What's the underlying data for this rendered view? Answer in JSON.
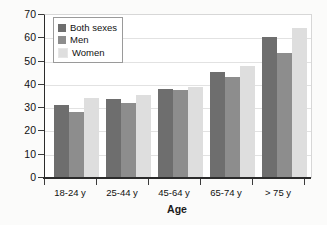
{
  "chart_data": {
    "type": "bar",
    "title": "",
    "xlabel": "Age",
    "ylabel": "Percent Physically Inactive",
    "categories": [
      "18-24 y",
      "25-44 y",
      "45-64 y",
      "65-74 y",
      "> 75 y"
    ],
    "series": [
      {
        "name": "Both sexes",
        "color": "#6e6e6e",
        "values": [
          31.4,
          33.8,
          38.4,
          45.6,
          60.4
        ]
      },
      {
        "name": "Men",
        "color": "#8d8d8d",
        "values": [
          28.4,
          32.2,
          38.0,
          43.5,
          53.6
        ]
      },
      {
        "name": "Women",
        "color": "#dedede",
        "values": [
          34.2,
          35.6,
          38.9,
          47.9,
          64.6
        ]
      }
    ],
    "ylim": [
      0,
      70
    ],
    "yticks": [
      0,
      10,
      20,
      30,
      40,
      50,
      60,
      70
    ],
    "ytick_labels": [
      "0",
      "10",
      "20",
      "30",
      "40",
      "50",
      "60",
      "70"
    ],
    "grid": true,
    "grid_axis": "y",
    "legend_position": "upper left",
    "legend_entries": [
      "Both sexes",
      "Men",
      "Women"
    ]
  }
}
